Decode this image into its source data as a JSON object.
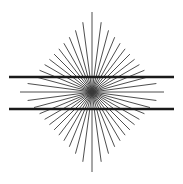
{
  "figure": {
    "name": "hering-illusion",
    "width": 183,
    "height": 184,
    "background_color": "#ffffff"
  },
  "chart_data": {
    "type": "scatter",
    "subtitle": "Radial fan with two straight parallel horizontal lines",
    "xlabel": "",
    "ylabel": "",
    "xlim": [
      0,
      183
    ],
    "ylim": [
      0,
      184
    ],
    "grid": false,
    "legend": "none",
    "annotations": [],
    "center": {
      "x": 92,
      "y": 92
    },
    "ray_count": 48,
    "ray_color": "#3a3a3a",
    "ray_width": 0.9,
    "ray_envelope": {
      "shape": "diamond",
      "half_width": 72,
      "half_height": 80
    },
    "ray_angles_deg": [
      0,
      7.5,
      15,
      22.5,
      30,
      37.5,
      45,
      52.5,
      60,
      67.5,
      75,
      82.5,
      90,
      97.5,
      105,
      112.5,
      120,
      127.5,
      135,
      142.5,
      150,
      157.5,
      165,
      172.5,
      180,
      187.5,
      195,
      202.5,
      210,
      217.5,
      225,
      232.5,
      240,
      247.5,
      255,
      262.5,
      270,
      277.5,
      285,
      292.5,
      300,
      307.5,
      315,
      322.5,
      330,
      337.5,
      345,
      352.5
    ],
    "horizontal_lines": [
      {
        "name": "upper-parallel-line",
        "y": 77,
        "x_start": 9,
        "x_end": 174
      },
      {
        "name": "lower-parallel-line",
        "y": 109,
        "x_start": 9,
        "x_end": 174
      }
    ],
    "line_color": "#1a1a1a",
    "line_width": 2.4
  }
}
